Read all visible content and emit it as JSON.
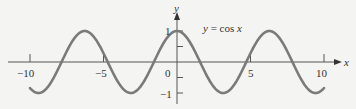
{
  "chart_data": {
    "type": "line",
    "title": "",
    "annotation": "y = cos x",
    "xlabel": "x",
    "ylabel": "y",
    "xlim": [
      -10,
      10
    ],
    "ylim": [
      -1,
      1
    ],
    "x_ticks": [
      "-10",
      "-5",
      "0",
      "5",
      "10"
    ],
    "y_ticks": [
      "1",
      "-1"
    ],
    "grid": false,
    "series": [
      {
        "name": "y = cos x",
        "function": "cos(x)",
        "x_range": [
          -10,
          10
        ],
        "color": "#777777"
      }
    ]
  },
  "labels": {
    "annotation": "y = cos x",
    "x_axis": "x",
    "y_axis": "y",
    "tick_neg10": "−10",
    "tick_neg5": "−5",
    "tick_0": "0",
    "tick_5": "5",
    "tick_10": "10",
    "tick_y1": "1",
    "tick_yneg1": "−1"
  }
}
